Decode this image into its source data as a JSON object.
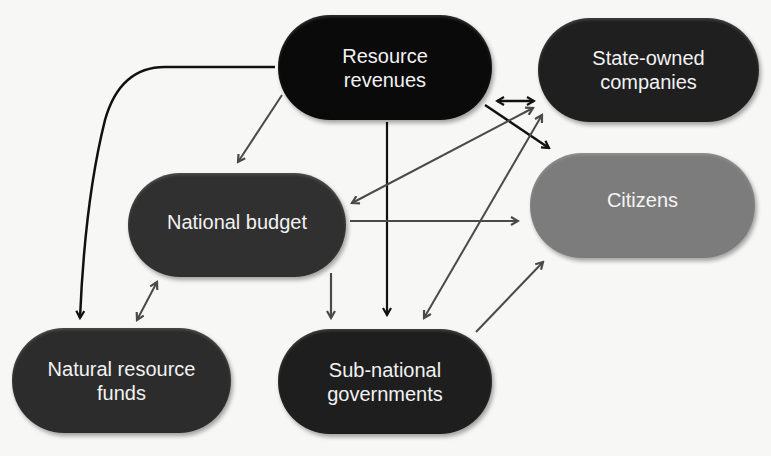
{
  "diagram": {
    "nodes": {
      "resource_revenues": {
        "label": "Resource\nrevenues",
        "color": "#0a0a0a"
      },
      "state_owned": {
        "label": "State-owned\ncompanies",
        "color": "#1f1f1f"
      },
      "citizens": {
        "label": "Citizens",
        "color": "#7c7c7c"
      },
      "national_budget": {
        "label": "National budget",
        "color": "#303030"
      },
      "nrf": {
        "label": "Natural resource\nfunds",
        "color": "#2c2c2c"
      },
      "subnational": {
        "label": "Sub-national\ngovernments",
        "color": "#1e1e1e"
      }
    },
    "edges": [
      {
        "from": "Resource revenues",
        "to": "State-owned companies",
        "direction": "both"
      },
      {
        "from": "Resource revenues",
        "to": "Citizens",
        "direction": "forward"
      },
      {
        "from": "Resource revenues",
        "to": "National budget",
        "direction": "forward"
      },
      {
        "from": "Resource revenues",
        "to": "Sub-national governments",
        "direction": "forward"
      },
      {
        "from": "Resource revenues",
        "to": "Natural resource funds",
        "direction": "forward"
      },
      {
        "from": "National budget",
        "to": "State-owned companies",
        "direction": "both"
      },
      {
        "from": "National budget",
        "to": "Citizens",
        "direction": "forward"
      },
      {
        "from": "National budget",
        "to": "Sub-national governments",
        "direction": "forward"
      },
      {
        "from": "National budget",
        "to": "Natural resource funds",
        "direction": "both"
      },
      {
        "from": "Sub-national governments",
        "to": "State-owned companies",
        "direction": "both"
      },
      {
        "from": "Sub-national governments",
        "to": "Citizens",
        "direction": "forward"
      }
    ]
  }
}
